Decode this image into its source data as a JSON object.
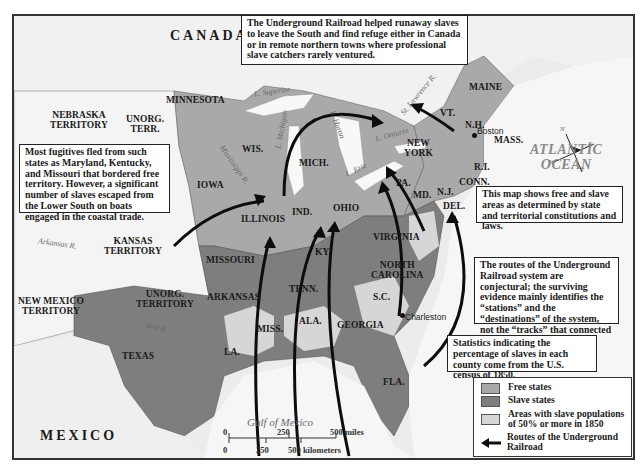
{
  "map": {
    "countries": {
      "canada": "CANADA",
      "mexico": "MEXICO"
    },
    "territories": {
      "nebraska": [
        "NEBRASKA",
        "TERRITORY"
      ],
      "unorg_north": [
        "UNORG.",
        "TERR."
      ],
      "kansas": [
        "KANSAS",
        "TERRITORY"
      ],
      "unorg_south": [
        "UNORG.",
        "TERRITORY"
      ],
      "new_mexico": [
        "NEW MEXICO",
        "TERRITORY"
      ]
    },
    "states": {
      "minnesota": "MINNESOTA",
      "wisconsin": "WIS.",
      "iowa": "IOWA",
      "michigan": "MICH.",
      "illinois": "ILLINOIS",
      "indiana": "IND.",
      "ohio": "OHIO",
      "missouri": "MISSOURI",
      "kentucky": "KY.",
      "tennessee": "TENN.",
      "arkansas": "ARKANSAS",
      "texas": "TEXAS",
      "louisiana": "LA.",
      "mississippi": "MISS.",
      "alabama": "ALA.",
      "georgia": "GEORGIA",
      "florida": "FLA.",
      "south_carolina": "S.C.",
      "north_carolina": [
        "NORTH",
        "CAROLINA"
      ],
      "virginia": "VIRGINIA",
      "maryland": "MD.",
      "delaware": "DEL.",
      "new_jersey": "N.J.",
      "pennsylvania": "PA.",
      "new_york": [
        "NEW",
        "YORK"
      ],
      "connecticut": "CONN.",
      "rhode_island": "R.I.",
      "massachusetts": "MASS.",
      "vermont": "VT.",
      "new_hampshire": "N.H.",
      "maine": "MAINE"
    },
    "water": {
      "superior": "L. Superior",
      "michigan": "L. Michigan",
      "huron": "L. Huron",
      "erie": "L. Erie",
      "ontario": "L. Ontario",
      "st_lawrence": "St. Lawrence R.",
      "mississippi": "Mississippi R.",
      "missouri_r": "Missouri R.",
      "ohio_r": "Ohio R.",
      "arkansas_r": "Arkansas R.",
      "red_r": "Red R.",
      "hudson": "Hudson R.",
      "gulf": "Gulf of Mexico",
      "atlantic": [
        "ATLANTIC",
        "OCEAN"
      ]
    },
    "cities": {
      "boston": "Boston",
      "charleston": "Charleston"
    },
    "compass": {
      "n": "N",
      "e": "E",
      "s": "S",
      "w": "W"
    },
    "colors": {
      "free_states": "#a9a9a9",
      "slave_states": "#7e7e7e",
      "majority_slave_areas": "#d6d6d6",
      "territory": "#f2f2f2",
      "water": "#f6f6f6",
      "route": "#0d0d0d"
    }
  },
  "notes": {
    "top": "The Underground Railroad helped runaway slaves to leave the South and find refuge either in Canada or in remote northern towns where professional slave catchers rarely ventured.",
    "left": "Most fugitives fled from such states as Maryland, Kentucky, and Missouri that bordered free territory. However, a significant number of slaves escaped from the Lower South on boats engaged in the coastal trade.",
    "free_slave": "This map shows free and slave areas as determined by state and territorial constitutions and laws.",
    "routes": "The routes of the Underground Railroad system are conjectural; the surviving evidence mainly identifies the “stations” and the “destinations” of the system, not the “tracks” that connected them.",
    "census": "Statistics indicating the percentage of slaves in each county come from the U.S. census of 1850."
  },
  "legend": {
    "items": [
      {
        "label": "Free states",
        "swatch": "#a9a9a9"
      },
      {
        "label": "Slave states",
        "swatch": "#7e7e7e"
      },
      {
        "label": "Areas with slave populations of 50% or more in 1850",
        "swatch": "#d6d6d6"
      },
      {
        "label": "Routes of the Underground Railroad",
        "swatch": "arrow"
      }
    ]
  },
  "scale_bar": {
    "miles_ticks": [
      "0",
      "250",
      "500 miles"
    ],
    "km_ticks": [
      "0",
      "250",
      "500 kilometers"
    ]
  }
}
